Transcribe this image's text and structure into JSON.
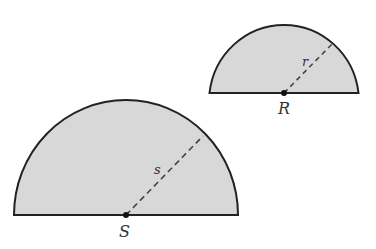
{
  "diagram": {
    "fill_color": "#d8d8d8",
    "stroke_color": "#222222",
    "small_semicircle": {
      "center_label": "R",
      "radius_label": "r"
    },
    "large_semicircle": {
      "center_label": "S",
      "radius_label": "s"
    }
  }
}
